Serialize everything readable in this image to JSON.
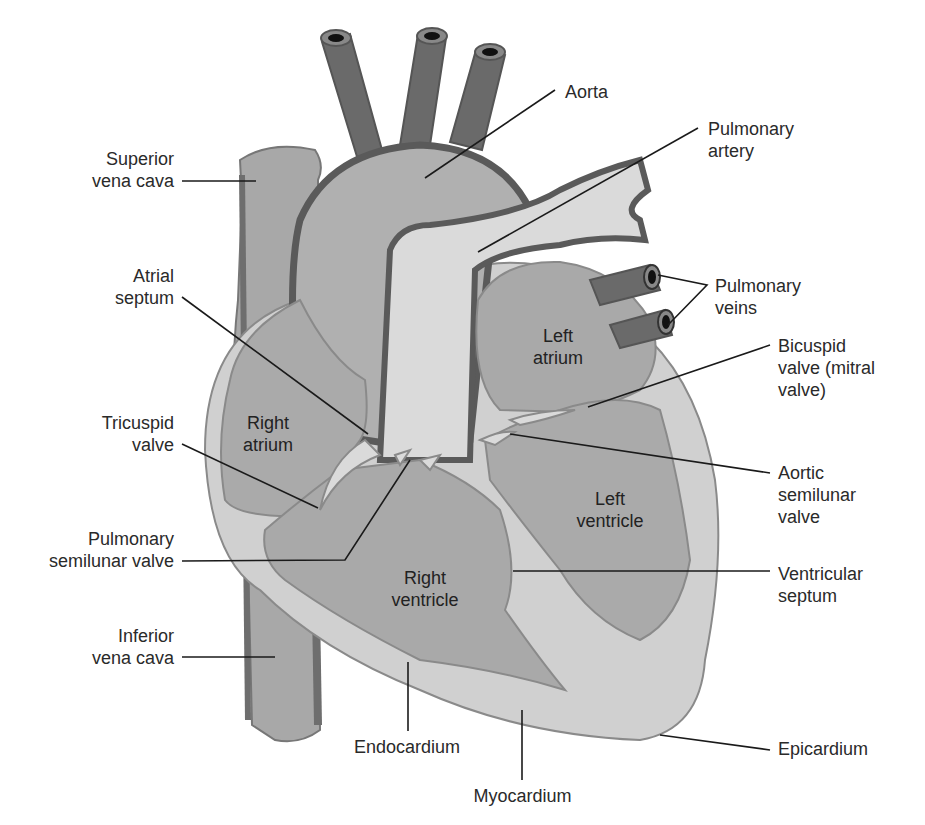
{
  "diagram": {
    "type": "labeled anatomical illustration",
    "colors": {
      "background": "#ffffff",
      "vessel_dark": "#6a6a6a",
      "vessel_wall": "#555555",
      "chamber_fill": "#a9a9a9",
      "myocardium_fill": "#d2d2d2",
      "light_vessel": "#dadada",
      "outline": "#8a8a8a",
      "leader_line": "#1a1a1a",
      "label_text": "#2a2a2a"
    },
    "labels_left": [
      {
        "id": "superior-vena-cava",
        "text": "Superior\nvena cava"
      },
      {
        "id": "atrial-septum",
        "text": "Atrial\nseptum"
      },
      {
        "id": "tricuspid-valve",
        "text": "Tricuspid\nvalve"
      },
      {
        "id": "pulmonary-semilunar-valve",
        "text": "Pulmonary\nsemilunar valve"
      },
      {
        "id": "inferior-vena-cava",
        "text": "Inferior\nvena cava"
      }
    ],
    "labels_right": [
      {
        "id": "aorta",
        "text": "Aorta"
      },
      {
        "id": "pulmonary-artery",
        "text": "Pulmonary\nartery"
      },
      {
        "id": "pulmonary-veins",
        "text": "Pulmonary\nveins"
      },
      {
        "id": "bicuspid-valve",
        "text": "Bicuspid\nvalve (mitral\nvalve)"
      },
      {
        "id": "aortic-semilunar-valve",
        "text": "Aortic\nsemilunar\nvalve"
      },
      {
        "id": "ventricular-septum",
        "text": "Ventricular\nseptum"
      },
      {
        "id": "epicardium",
        "text": "Epicardium"
      }
    ],
    "labels_bottom": [
      {
        "id": "endocardium",
        "text": "Endocardium"
      },
      {
        "id": "myocardium",
        "text": "Myocardium"
      }
    ],
    "chamber_labels": [
      {
        "id": "right-atrium",
        "text": "Right\natrium"
      },
      {
        "id": "left-atrium",
        "text": "Left\natrium"
      },
      {
        "id": "left-ventricle",
        "text": "Left\nventricle"
      },
      {
        "id": "right-ventricle",
        "text": "Right\nventricle"
      }
    ]
  }
}
